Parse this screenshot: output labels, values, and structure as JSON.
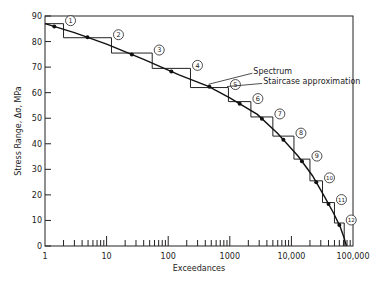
{
  "chart_data": {
    "type": "line",
    "title": "",
    "xlabel": "Exceedances",
    "ylabel": "Stress Range, Δσ, MPa",
    "xscale": "log",
    "xlim": [
      1,
      100000
    ],
    "ylim": [
      0,
      90
    ],
    "x_tick_labels": [
      "1",
      "10",
      "100",
      "1000",
      "10,000",
      "100,000"
    ],
    "x_ticks": [
      1,
      10,
      100,
      1000,
      10000,
      100000
    ],
    "y_tick_labels": [
      "0",
      "10",
      "20",
      "30",
      "40",
      "50",
      "60",
      "70",
      "80",
      "90"
    ],
    "y_ticks": [
      0,
      10,
      20,
      30,
      40,
      50,
      60,
      70,
      80,
      90
    ],
    "grid": false,
    "annotations": [
      {
        "text": "Spectrum",
        "x": 2000,
        "y": 68
      },
      {
        "text": "Staircase approximation",
        "x": 3000,
        "y": 64
      }
    ],
    "series": [
      {
        "name": "Spectrum",
        "type": "curve",
        "x": [
          1,
          3,
          10,
          40,
          150,
          450,
          1000,
          2800,
          6000,
          13000,
          22000,
          35000,
          48000,
          62000,
          72000,
          78000
        ],
        "y": [
          87,
          83.5,
          79,
          73,
          67,
          62.5,
          58,
          51.5,
          44,
          35,
          27.5,
          19,
          13,
          7.5,
          3,
          0
        ]
      },
      {
        "name": "Staircase approximation",
        "type": "step",
        "steps": [
          {
            "block": 1,
            "x_start": 1,
            "x_end": 2,
            "level": 87
          },
          {
            "block": 2,
            "x_start": 2,
            "x_end": 12,
            "level": 81.5
          },
          {
            "block": 3,
            "x_start": 12,
            "x_end": 55,
            "level": 75.5
          },
          {
            "block": 4,
            "x_start": 55,
            "x_end": 230,
            "level": 69.5
          },
          {
            "block": 5,
            "x_start": 230,
            "x_end": 950,
            "level": 62
          },
          {
            "block": 6,
            "x_start": 950,
            "x_end": 2200,
            "level": 56.5
          },
          {
            "block": 7,
            "x_start": 2200,
            "x_end": 5000,
            "level": 50.5
          },
          {
            "block": 8,
            "x_start": 5000,
            "x_end": 11000,
            "level": 43
          },
          {
            "block": 9,
            "x_start": 11000,
            "x_end": 20000,
            "level": 34
          },
          {
            "block": 10,
            "x_start": 20000,
            "x_end": 32000,
            "level": 25.5
          },
          {
            "block": 11,
            "x_start": 32000,
            "x_end": 50000,
            "level": 17
          },
          {
            "block": 12,
            "x_start": 50000,
            "x_end": 72000,
            "level": 9
          }
        ]
      }
    ],
    "block_labels": [
      "1",
      "2",
      "3",
      "4",
      "5",
      "6",
      "7",
      "8",
      "9",
      "10",
      "11",
      "12"
    ]
  }
}
